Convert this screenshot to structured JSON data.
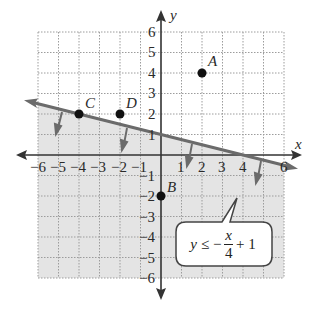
{
  "graph": {
    "x_axis_label": "x",
    "y_axis_label": "y",
    "x_ticks": [
      "−6",
      "−5",
      "−4",
      "−3",
      "−2",
      "−1",
      "1",
      "2",
      "3",
      "4",
      "6"
    ],
    "y_ticks": [
      "6",
      "5",
      "4",
      "3",
      "2",
      "1",
      "−1",
      "−2",
      "−3",
      "−4",
      "−5",
      "−6"
    ],
    "points": [
      {
        "label": "A",
        "x": 2,
        "y": 4
      },
      {
        "label": "B",
        "x": 0,
        "y": -2
      },
      {
        "label": "C",
        "x": -4,
        "y": 2
      },
      {
        "label": "D",
        "x": -2,
        "y": 2
      }
    ],
    "boundary_line": {
      "slope": -0.25,
      "intercept": 1,
      "style": "solid"
    },
    "shaded_region": "below",
    "colors": {
      "shade": "#e6e6e6",
      "line": "#6b6b6b",
      "axis": "#333333",
      "grid": "#9a9a9a",
      "point": "#111111"
    }
  },
  "callout": {
    "lhs": "y",
    "op": "≤ −",
    "numerator": "x",
    "denominator": "4",
    "rhs": "+ 1"
  }
}
